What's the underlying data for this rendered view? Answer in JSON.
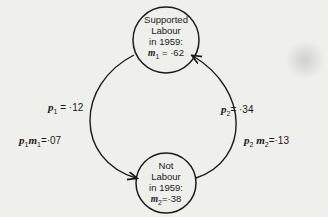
{
  "diagram": {
    "nodes": [
      {
        "id": "supported",
        "lines": [
          "Supported",
          "Labour",
          "in 1959:"
        ],
        "var": "m",
        "sub": "1",
        "value": "·62",
        "eq": "="
      },
      {
        "id": "not",
        "lines": [
          "Not",
          "Labour",
          "in 1959:"
        ],
        "var": "m",
        "sub": "2",
        "value": "·38",
        "eq": "="
      }
    ],
    "edges": [
      {
        "from": "supported",
        "to": "not",
        "label": {
          "sym": "p",
          "sub": "1",
          "text": "= ·12"
        }
      },
      {
        "from": "not",
        "to": "supported",
        "label": {
          "sym": "p",
          "sub": "2",
          "text": "= ·34"
        }
      }
    ],
    "products": [
      {
        "sym1": "p",
        "sub1": "1",
        "sym2": "m",
        "sub2": "1",
        "text": "=·07"
      },
      {
        "sym1": "p",
        "sub1": "2",
        "sym2": "m",
        "sub2": "2",
        "text": "=·13"
      }
    ]
  }
}
